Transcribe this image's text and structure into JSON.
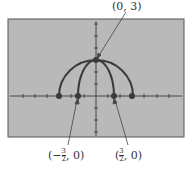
{
  "labels": {
    "top": "(0, 3)",
    "left": {
      "open": "(",
      "sign": "−",
      "num": "3",
      "den": "2",
      "close": ", 0)"
    },
    "right": {
      "open": "(",
      "num": "3",
      "den": "2",
      "close": ", 0)"
    }
  },
  "colors": {
    "screen": "#b9b9b9",
    "curve": "#3a3a3a",
    "axis": "#444444",
    "border": "#555555"
  },
  "points": [
    {
      "name": "top",
      "x": 0,
      "y": 3
    },
    {
      "name": "outer-left",
      "x": -3,
      "y": 0
    },
    {
      "name": "inner-left",
      "x": -1.5,
      "y": 0
    },
    {
      "name": "inner-right",
      "x": 1.5,
      "y": 0
    },
    {
      "name": "outer-right",
      "x": 3,
      "y": 0
    }
  ]
}
